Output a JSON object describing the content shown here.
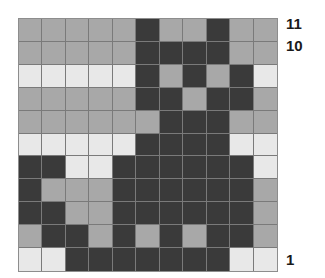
{
  "chart_data": {
    "type": "heatmap",
    "title": "",
    "subtitle": "",
    "xlabel": "",
    "ylabel": "",
    "grid": true,
    "legend_position": "none",
    "columns": 11,
    "rows": 11,
    "row_labels_visible": [
      "11",
      "10",
      "1"
    ],
    "row_label_positions": [
      11,
      10,
      1
    ],
    "color_key": {
      "D": "#3a3a3a",
      "M": "#a8a8a8",
      "L": "#e8e8e8"
    },
    "color_names": {
      "D": "dark",
      "M": "medium-gray",
      "L": "light"
    },
    "note": "Row 1 in the data array is the topmost row (labelled 11); the last row is labelled 1.",
    "cells": [
      [
        "M",
        "M",
        "M",
        "M",
        "M",
        "D",
        "M",
        "M",
        "D",
        "M",
        "M"
      ],
      [
        "M",
        "M",
        "M",
        "M",
        "M",
        "D",
        "D",
        "D",
        "D",
        "M",
        "M"
      ],
      [
        "L",
        "L",
        "L",
        "L",
        "L",
        "D",
        "M",
        "D",
        "M",
        "D",
        "L"
      ],
      [
        "M",
        "M",
        "M",
        "M",
        "M",
        "D",
        "D",
        "M",
        "D",
        "D",
        "M"
      ],
      [
        "M",
        "M",
        "M",
        "M",
        "M",
        "M",
        "D",
        "D",
        "D",
        "M",
        "M"
      ],
      [
        "L",
        "L",
        "L",
        "L",
        "L",
        "D",
        "D",
        "D",
        "D",
        "L",
        "L"
      ],
      [
        "D",
        "D",
        "L",
        "L",
        "D",
        "D",
        "D",
        "D",
        "D",
        "D",
        "L"
      ],
      [
        "D",
        "M",
        "M",
        "M",
        "D",
        "D",
        "D",
        "D",
        "D",
        "D",
        "M"
      ],
      [
        "D",
        "D",
        "M",
        "M",
        "D",
        "D",
        "D",
        "D",
        "D",
        "D",
        "M"
      ],
      [
        "M",
        "D",
        "D",
        "M",
        "D",
        "M",
        "D",
        "M",
        "D",
        "D",
        "M"
      ],
      [
        "L",
        "L",
        "D",
        "D",
        "D",
        "D",
        "D",
        "D",
        "D",
        "L",
        "L"
      ]
    ]
  },
  "labels": {
    "top": "11",
    "second": "10",
    "bottom": "1"
  }
}
